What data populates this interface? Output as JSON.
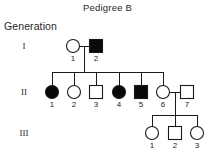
{
  "chart_data": {
    "type": "diagram",
    "diagram_kind": "pedigree",
    "title": "Pedigree B",
    "axis_label": "Generation",
    "legend": {
      "circle": "female",
      "square": "male",
      "filled": "affected",
      "open": "unaffected"
    },
    "colors": {
      "stroke": "#1a1a1a",
      "affected_fill": "#0a0a0a",
      "unaffected_fill": "#ffffff",
      "background": "#ffffff"
    },
    "generations": [
      {
        "roman": "I",
        "y": 46,
        "individuals": [
          {
            "id": "1",
            "label": "1",
            "sex": "female",
            "shape": "circle",
            "affected": false,
            "x": 73
          },
          {
            "id": "2",
            "label": "2",
            "sex": "male",
            "shape": "square",
            "affected": true,
            "x": 96
          }
        ]
      },
      {
        "roman": "II",
        "y": 92,
        "individuals": [
          {
            "id": "1",
            "label": "1",
            "sex": "female",
            "shape": "circle",
            "affected": true,
            "x": 52
          },
          {
            "id": "2",
            "label": "2",
            "sex": "female",
            "shape": "circle",
            "affected": false,
            "x": 74
          },
          {
            "id": "3",
            "label": "3",
            "sex": "male",
            "shape": "square",
            "affected": false,
            "x": 96
          },
          {
            "id": "4",
            "label": "4",
            "sex": "female",
            "shape": "circle",
            "affected": true,
            "x": 119
          },
          {
            "id": "5",
            "label": "5",
            "sex": "male",
            "shape": "square",
            "affected": true,
            "x": 141
          },
          {
            "id": "6",
            "label": "6",
            "sex": "female",
            "shape": "circle",
            "affected": false,
            "x": 163
          },
          {
            "id": "7",
            "label": "7",
            "sex": "male",
            "shape": "square",
            "affected": false,
            "x": 187
          }
        ]
      },
      {
        "roman": "III",
        "y": 133,
        "individuals": [
          {
            "id": "1",
            "label": "1",
            "sex": "female",
            "shape": "circle",
            "affected": false,
            "x": 152
          },
          {
            "id": "2",
            "label": "2",
            "sex": "male",
            "shape": "square",
            "affected": false,
            "x": 175
          },
          {
            "id": "3",
            "label": "3",
            "sex": "female",
            "shape": "circle",
            "affected": false,
            "x": 197
          }
        ]
      }
    ],
    "matings": [
      {
        "partners": [
          "I-1",
          "I-2"
        ],
        "children": [
          "II-1",
          "II-2",
          "II-3",
          "II-4",
          "II-5",
          "II-6"
        ]
      },
      {
        "partners": [
          "II-6",
          "II-7"
        ],
        "children": [
          "III-1",
          "III-2",
          "III-3"
        ]
      }
    ]
  }
}
